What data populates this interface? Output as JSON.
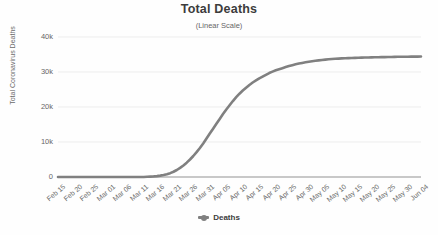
{
  "chart_data": {
    "type": "line",
    "title": "Total Deaths",
    "subtitle": "(Linear Scale)",
    "xlabel": "",
    "ylabel": "Total Coronavirus Deaths",
    "ylim": [
      0,
      40000
    ],
    "ytick_labels": [
      "0",
      "10k",
      "20k",
      "30k",
      "40k"
    ],
    "ytick_values": [
      0,
      10000,
      20000,
      30000,
      40000
    ],
    "grid": true,
    "legend_position": "bottom",
    "legend": [
      "Deaths"
    ],
    "series": [
      {
        "name": "Deaths",
        "color": "#808080",
        "values": [
          0,
          0,
          0,
          0,
          0,
          0,
          0,
          0,
          0,
          0,
          0,
          0,
          0,
          0,
          0,
          0,
          0,
          0,
          0,
          0,
          0,
          0,
          0,
          0,
          0,
          0,
          0,
          60,
          110,
          170,
          260,
          390,
          560,
          800,
          1100,
          1500,
          2000,
          2600,
          3300,
          4100,
          5000,
          6000,
          7100,
          8300,
          9600,
          11000,
          12400,
          13800,
          15200,
          16600,
          18000,
          19300,
          20500,
          21700,
          22800,
          23800,
          24700,
          25500,
          26300,
          27000,
          27600,
          28200,
          28700,
          29200,
          29700,
          30100,
          30500,
          30800,
          31100,
          31400,
          31700,
          31950,
          32200,
          32400,
          32600,
          32780,
          32940,
          33080,
          33200,
          33320,
          33430,
          33530,
          33620,
          33700,
          33770,
          33830,
          33880,
          33930,
          33970,
          34010,
          34050,
          34080,
          34110,
          34140,
          34160,
          34180,
          34200,
          34220,
          34240,
          34260,
          34280,
          34300,
          34320,
          34340,
          34350,
          34360,
          34370,
          34380,
          34390,
          34400,
          34410
        ],
        "x_start": "Feb 15",
        "x_end": "Jun 04"
      }
    ],
    "xtick_labels": [
      "Feb 15",
      "Feb 20",
      "Feb 25",
      "Mar 01",
      "Mar 06",
      "Mar 11",
      "Mar 16",
      "Mar 21",
      "Mar 26",
      "Mar 31",
      "Apr 05",
      "Apr 10",
      "Apr 15",
      "Apr 20",
      "Apr 25",
      "Apr 30",
      "May 05",
      "May 10",
      "May 15",
      "May 20",
      "May 25",
      "May 30",
      "Jun 04"
    ]
  }
}
